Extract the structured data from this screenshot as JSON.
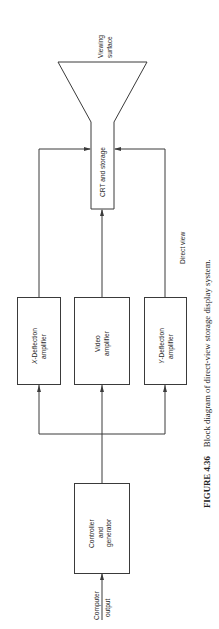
{
  "diagram": {
    "orientation": "rotated-90-ccw",
    "nodes": {
      "viewing_surface": {
        "line1": "Viewing",
        "line2": "surface"
      },
      "crt": {
        "label": "CRT and storage"
      },
      "x_deflection": {
        "prefix": "X",
        "line1_rest": "-Deflection",
        "line2": "amplifier"
      },
      "video": {
        "line1": "Video",
        "line2": "amplifier"
      },
      "y_deflection": {
        "prefix": "Y",
        "line1_rest": "-Deflection",
        "line2": "amplifier"
      },
      "controller": {
        "line1": "Controller",
        "line2": "and",
        "line3": "generator"
      },
      "input": {
        "line1": "Computer",
        "line2": "output"
      }
    },
    "annotations": {
      "direct_view": "Direct view"
    },
    "edges": [
      {
        "from": "Computer output",
        "to": "Controller and generator"
      },
      {
        "from": "Controller and generator",
        "to": "X-Deflection amplifier"
      },
      {
        "from": "Controller and generator",
        "to": "Video amplifier"
      },
      {
        "from": "Controller and generator",
        "to": "Y-Deflection amplifier"
      },
      {
        "from": "X-Deflection amplifier",
        "to": "CRT and storage"
      },
      {
        "from": "Video amplifier",
        "to": "CRT and storage"
      },
      {
        "from": "Y-Deflection amplifier",
        "to": "CRT and storage"
      }
    ]
  },
  "caption": {
    "figure_label": "FIGURE 4.36",
    "text": "Block diagram of direct-view storage display system."
  },
  "colors": {
    "line": "#3a3a3a",
    "text": "#2a2a2a",
    "background": "#ffffff"
  }
}
